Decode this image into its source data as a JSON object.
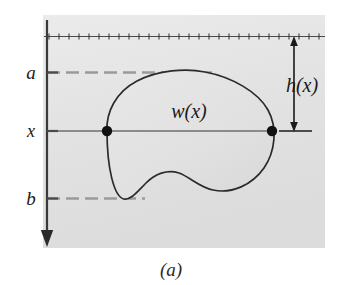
{
  "figure": {
    "caption": "(a)",
    "panel_fill": "#e2e2e2",
    "ink_color": "#1a1a1a",
    "guide_color": "#8a8a8a",
    "labels": {
      "upper_bound": "a",
      "lower_bound": "b",
      "depth_variable": "x",
      "width_function": "w(x)",
      "depth_function": "h(x)"
    },
    "elements": {
      "water_surface_name": "water-surface-line",
      "axis_name": "vertical-depth-axis",
      "region_name": "submerged-plate-region",
      "strip_name": "horizontal-strip-line",
      "dimension_name": "depth-dimension-arrow"
    },
    "geometry": {
      "panel": {
        "x": 43,
        "y": 15,
        "width": 282,
        "height": 233
      },
      "axis_x": 47,
      "axis_top": 20,
      "axis_bottom": 247,
      "water_surface_y": 36,
      "a_y": 72,
      "x_y": 131,
      "b_y": 198,
      "left_dot_x": 107,
      "right_dot_x": 272,
      "h_arrow_x": 294,
      "h_arrow_top": 37,
      "h_arrow_bottom": 131
    }
  }
}
